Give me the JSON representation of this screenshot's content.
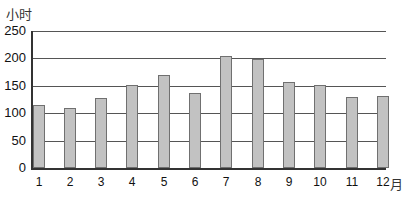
{
  "chart_data": {
    "type": "bar",
    "title": "",
    "xlabel": "月",
    "ylabel": "小时",
    "categories": [
      "1",
      "2",
      "3",
      "4",
      "5",
      "6",
      "7",
      "8",
      "9",
      "10",
      "11",
      "12"
    ],
    "values": [
      115,
      110,
      128,
      152,
      170,
      137,
      204,
      198,
      157,
      152,
      130,
      131
    ],
    "ylim": [
      0,
      250
    ],
    "yticks": [
      0,
      50,
      100,
      150,
      200,
      250
    ],
    "grid": true,
    "legend": null,
    "colors": {
      "bar_fill": "#c2c2c2",
      "bar_edge": "#707070",
      "grid": "#555555"
    }
  }
}
